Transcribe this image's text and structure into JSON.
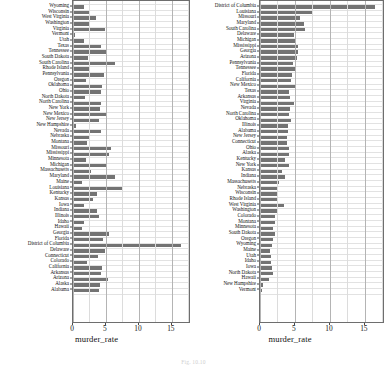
{
  "figure": {
    "caption": "Fig. 10.10"
  },
  "chart_data": [
    {
      "type": "bar",
      "orientation": "horizontal",
      "panel": "left",
      "title": "",
      "xlabel": "murder_rate",
      "ylabel": "",
      "xlim": [
        0,
        17.6
      ],
      "xticks": [
        0,
        5,
        10,
        15
      ],
      "xticklabels": [
        "0",
        "5",
        "10",
        "15"
      ],
      "grid": true,
      "sort": "state name, reverse alphabetical",
      "bar_color": "#737373",
      "categories": [
        "Wyoming",
        "Wisconsin",
        "West Virginia",
        "Washington",
        "Virginia",
        "Vermont",
        "Utah",
        "Texas",
        "Tennessee",
        "South Dakota",
        "South Carolina",
        "Rhode Island",
        "Pennsylvania",
        "Oregon",
        "Oklahoma",
        "Ohio",
        "North Dakota",
        "North Carolina",
        "New York",
        "New Mexico",
        "New Jersey",
        "New Hampshire",
        "Nevada",
        "Nebraska",
        "Montana",
        "Missouri",
        "Mississippi",
        "Minnesota",
        "Michigan",
        "Massachusetts",
        "Maryland",
        "Maine",
        "Louisiana",
        "Kentucky",
        "Kansas",
        "Iowa",
        "Indiana",
        "Illinois",
        "Idaho",
        "Hawaii",
        "Georgia",
        "Florida",
        "District of Columbia",
        "Delaware",
        "Connecticut",
        "Colorado",
        "California",
        "Arkansas",
        "Arizona",
        "Alaska",
        "Alabama"
      ],
      "values": [
        1.7,
        2.4,
        3.5,
        2.6,
        4.8,
        0.3,
        1.6,
        4.2,
        5.0,
        2.2,
        6.4,
        2.4,
        4.7,
        1.9,
        4.4,
        4.2,
        1.8,
        4.2,
        4.1,
        5.1,
        3.9,
        0.4,
        4.3,
        2.4,
        2.1,
        5.7,
        5.4,
        1.9,
        5.1,
        2.7,
        6.3,
        1.4,
        7.6,
        3.6,
        3.1,
        1.7,
        3.6,
        4.0,
        1.6,
        1.3,
        5.4,
        4.6,
        16.4,
        4.8,
        3.8,
        2.1,
        4.4,
        4.3,
        5.3,
        4.1,
        4.0
      ]
    },
    {
      "type": "bar",
      "orientation": "horizontal",
      "panel": "right",
      "title": "",
      "xlabel": "murder_rate",
      "ylabel": "",
      "xlim": [
        0,
        17.6
      ],
      "xticks": [
        0,
        5,
        10,
        15
      ],
      "xticklabels": [
        "0",
        "5",
        "10",
        "15"
      ],
      "grid": true,
      "sort": "murder_rate, descending",
      "bar_color": "#737373",
      "categories": [
        "District of Columbia",
        "Louisiana",
        "Missouri",
        "Maryland",
        "South Carolina",
        "Delaware",
        "Michigan",
        "Mississippi",
        "Georgia",
        "Arizona",
        "Pennsylvania",
        "Tennessee",
        "Florida",
        "California",
        "New Mexico",
        "Texas",
        "Arkansas",
        "Virginia",
        "Nevada",
        "North Carolina",
        "Oklahoma",
        "Illinois",
        "Alabama",
        "New Jersey",
        "Connecticut",
        "Ohio",
        "Alaska",
        "Kentucky",
        "New York",
        "Kansas",
        "Indiana",
        "Massachusetts",
        "Nebraska",
        "Wisconsin",
        "Rhode Island",
        "West Virginia",
        "Washington",
        "Colorado",
        "Montana",
        "Minnesota",
        "South Dakota",
        "Oregon",
        "Wyoming",
        "Maine",
        "Utah",
        "Idaho",
        "Iowa",
        "North Dakota",
        "Hawaii",
        "New Hampshire",
        "Vermont"
      ],
      "values": [
        16.4,
        7.6,
        5.7,
        6.3,
        6.4,
        4.8,
        5.1,
        5.4,
        5.4,
        5.3,
        4.7,
        5.0,
        4.6,
        4.4,
        5.1,
        4.2,
        4.3,
        4.8,
        4.3,
        4.2,
        4.4,
        4.0,
        4.0,
        3.9,
        3.8,
        4.2,
        4.1,
        3.6,
        4.1,
        3.1,
        3.6,
        2.7,
        2.4,
        2.4,
        2.4,
        3.5,
        2.6,
        2.1,
        2.1,
        1.9,
        2.2,
        1.9,
        1.7,
        1.4,
        1.6,
        1.6,
        1.7,
        1.8,
        1.3,
        0.4,
        0.3
      ]
    }
  ]
}
